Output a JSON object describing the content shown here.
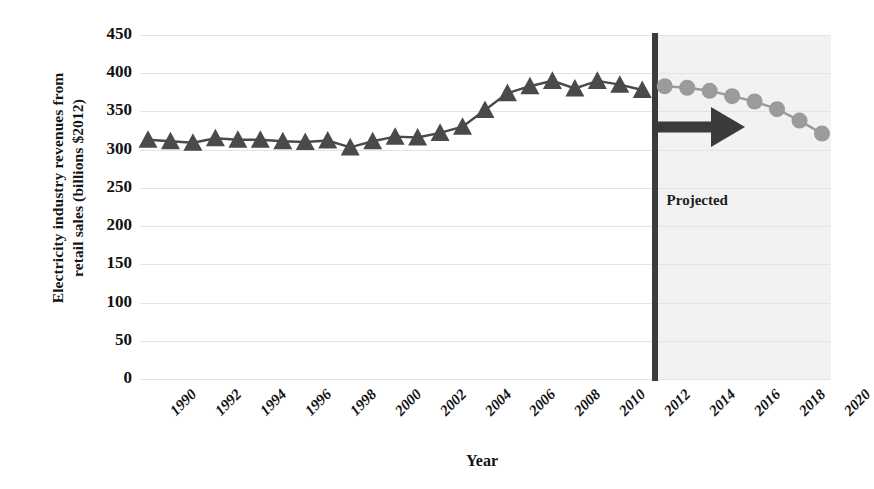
{
  "chart_data": {
    "type": "line",
    "title": "",
    "xlabel": "Year",
    "ylabel": "Electricity industry revenues from retail sales (billions $2012)",
    "ylabel_line1": "Electricity industry revenues from",
    "ylabel_line2": "retail sales (billions $2012)",
    "ylim": [
      0,
      450
    ],
    "ytick_step": 50,
    "yticks": [
      450,
      400,
      350,
      300,
      250,
      200,
      150,
      100,
      50,
      0
    ],
    "xlim": [
      1990,
      2020
    ],
    "xticks": [
      1990,
      1992,
      1994,
      1996,
      1998,
      2000,
      2002,
      2004,
      2006,
      2008,
      2010,
      2012,
      2014,
      2016,
      2018,
      2020
    ],
    "grid": "horizontal",
    "legend": "none",
    "annotation": "Projected",
    "projection_start_year": 2012,
    "series": [
      {
        "name": "Historical",
        "marker": "triangle",
        "color": "#4a4a4a",
        "x": [
          1990,
          1991,
          1992,
          1993,
          1994,
          1995,
          1996,
          1997,
          1998,
          1999,
          2000,
          2001,
          2002,
          2003,
          2004,
          2005,
          2006,
          2007,
          2008,
          2009,
          2010,
          2011,
          2012
        ],
        "values": [
          313,
          311,
          309,
          315,
          313,
          313,
          311,
          310,
          312,
          303,
          311,
          317,
          316,
          322,
          330,
          352,
          374,
          383,
          390,
          380,
          390,
          385,
          378
        ]
      },
      {
        "name": "Projected",
        "marker": "circle",
        "color": "#9b9b9b",
        "x": [
          2013,
          2014,
          2015,
          2016,
          2017,
          2018,
          2019,
          2020
        ],
        "values": [
          383,
          381,
          377,
          370,
          363,
          353,
          338,
          321
        ]
      }
    ]
  },
  "colors": {
    "historical": "#4a4a4a",
    "projected": "#9b9b9b",
    "grid": "#e3e3e5",
    "divider": "#3b3b3b",
    "band": "#f2f2f3",
    "text": "#111111"
  }
}
